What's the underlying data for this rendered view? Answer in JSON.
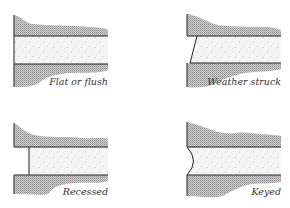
{
  "colors": {
    "brick_hatch": "#9a9a9a",
    "brick_fill": "#c8c8c8",
    "mortar_fill": "#f4f4f4",
    "mortar_speckle": "#8a8a8a",
    "line": "#222222",
    "label": "#333333"
  },
  "panels": [
    {
      "id": "flat-or-flush",
      "label": "Flat or flush"
    },
    {
      "id": "weather-struck",
      "label": "Weather struck"
    },
    {
      "id": "recessed",
      "label": "Recessed"
    },
    {
      "id": "keyed",
      "label": "Keyed"
    }
  ]
}
